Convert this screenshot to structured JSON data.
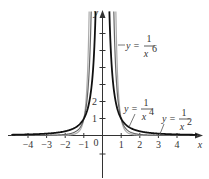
{
  "chart_data": {
    "type": "line",
    "title": "",
    "xlabel": "x",
    "ylabel": "y",
    "xlim": [
      -4.9,
      5.2
    ],
    "ylim": [
      -2.5,
      7.5
    ],
    "grid": false,
    "legend": "inline annotations",
    "x_ticks": [
      -4,
      -3,
      -2,
      -1,
      1,
      2,
      3,
      4
    ],
    "x_tick_labels": [
      "−4",
      "−3",
      "−2",
      "−1",
      "1",
      "2",
      "3",
      "4"
    ],
    "y_ticks": [
      -1,
      1,
      2,
      3,
      4,
      5,
      6,
      7
    ],
    "y_tick_labels_shown": [
      "1",
      "2"
    ],
    "origin_label": "0",
    "series": [
      {
        "name": "y = 1/x^2",
        "function": "1/x^2",
        "color": "#111111",
        "style": "solid-thick",
        "x": [
          -4.5,
          -3,
          -2,
          -1,
          -0.5,
          0.5,
          1,
          2,
          3,
          4.5
        ],
        "values": [
          0.049,
          0.111,
          0.25,
          1,
          4,
          4,
          1,
          0.25,
          0.111,
          0.049
        ]
      },
      {
        "name": "y = 1/x^4",
        "function": "1/x^4",
        "color": "#666666",
        "style": "solid",
        "x": [
          -4.5,
          -3,
          -2,
          -1,
          -0.6,
          0.6,
          1,
          2,
          3,
          4.5
        ],
        "values": [
          0.0024,
          0.012,
          0.0625,
          1,
          7.7,
          7.7,
          1,
          0.0625,
          0.012,
          0.0024
        ]
      },
      {
        "name": "y = 1/x^6",
        "function": "1/x^6",
        "color": "#aaaaaa",
        "style": "solid",
        "x": [
          -4.5,
          -3,
          -2,
          -1,
          -0.72,
          0.72,
          1,
          2,
          3,
          4.5
        ],
        "values": [
          0.0001,
          0.0014,
          0.0156,
          1,
          7.2,
          7.2,
          1,
          0.0156,
          0.0014,
          0.0001
        ]
      }
    ],
    "annotations": [
      {
        "text": "y = 1/x^6",
        "near_x": 1.4,
        "near_y": 6.3
      },
      {
        "text": "y = 1/x^4",
        "near_x": 1.7,
        "near_y": 1.4
      },
      {
        "text": "y = 1/x^2",
        "near_x": 3.7,
        "near_y": 1.1
      }
    ]
  },
  "labels": {
    "x_axis": "x",
    "y_axis": "y",
    "origin": "0",
    "ann1_y": "y =",
    "ann1_num": "1",
    "ann1_den": "x",
    "ann1_exp": "6",
    "ann2_y": "y =",
    "ann2_num": "1",
    "ann2_den": "x",
    "ann2_exp": "4",
    "ann3_y": "y =",
    "ann3_num": "1",
    "ann3_den": "x",
    "ann3_exp": "2",
    "xt": [
      "−4",
      "−3",
      "−2",
      "−1",
      "1",
      "2",
      "3",
      "4"
    ],
    "yt1": "1",
    "yt2": "2"
  }
}
